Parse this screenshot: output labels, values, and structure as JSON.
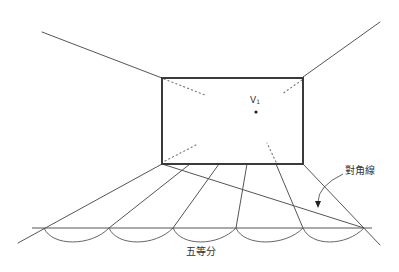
{
  "diagram": {
    "type": "one-point perspective room floor division",
    "colors": {
      "stroke": "#555555",
      "frame": "#3a3a3a",
      "text": "#333333",
      "background": "#ffffff"
    },
    "labels": {
      "vanishing_point": "V",
      "vanishing_point_sub": "1",
      "diagonal": "對角線",
      "five_equal": "五等分"
    },
    "back_wall_rect": {
      "x1": 162,
      "y1": 78,
      "x2": 303,
      "y2": 164
    },
    "vanishing_point": {
      "x": 256,
      "y": 112
    },
    "ceiling_lines": [
      {
        "from": [
          162,
          78
        ],
        "to": [
          42,
          32
        ]
      },
      {
        "from": [
          303,
          77
        ],
        "to": [
          380,
          22
        ]
      }
    ],
    "floor_base_points_x": [
      162,
      190,
      219,
      247,
      276,
      303
    ],
    "baseline": {
      "y": 228,
      "x_start": 32,
      "x_end": 372
    },
    "baseline_crossings_x": [
      44,
      109,
      173,
      236,
      303,
      364
    ],
    "floor_line_ends": [
      {
        "from": [
          162,
          164
        ],
        "to": [
          18,
          243
        ]
      },
      {
        "from": [
          190,
          164
        ],
        "to": [
          109,
          228
        ]
      },
      {
        "from": [
          219,
          164
        ],
        "to": [
          173,
          228
        ]
      },
      {
        "from": [
          247,
          164
        ],
        "to": [
          236,
          228
        ]
      },
      {
        "from": [
          276,
          164
        ],
        "to": [
          303,
          228
        ]
      },
      {
        "from": [
          303,
          164
        ],
        "to": [
          380,
          245
        ]
      }
    ],
    "diagonal": {
      "from": [
        162,
        164
      ],
      "to": [
        364,
        228
      ]
    },
    "arc_depth_y": 242,
    "dotted_corner_lines": [
      {
        "from": [
          164,
          79
        ],
        "to": [
          205,
          95
        ]
      },
      {
        "from": [
          302,
          80
        ],
        "to": [
          282,
          94
        ]
      },
      {
        "from": [
          165,
          161
        ],
        "to": [
          196,
          145
        ]
      },
      {
        "from": [
          276,
          162
        ],
        "to": [
          267,
          143
        ]
      }
    ],
    "arrow": {
      "from": [
        343,
        174
      ],
      "ctrl": [
        318,
        186
      ],
      "to": [
        318,
        208
      ]
    }
  }
}
